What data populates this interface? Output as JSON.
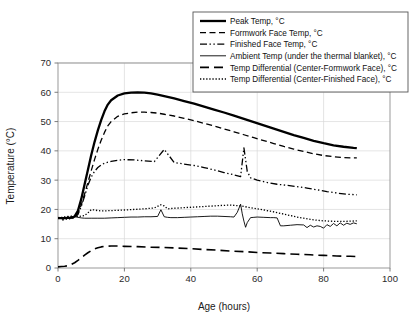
{
  "chart_data": {
    "type": "line",
    "title": "",
    "xlabel": "Age (hours)",
    "ylabel": "Temperature (°C)",
    "xlim": [
      0,
      100
    ],
    "ylim": [
      0,
      70
    ],
    "xticks": [
      0,
      20,
      40,
      60,
      80,
      100
    ],
    "yticks": [
      0,
      10,
      20,
      30,
      40,
      50,
      60,
      70
    ],
    "grid": true,
    "legend_position": "top-right",
    "series": [
      {
        "name": "Peak Temp, °C",
        "style": "solid-thick",
        "x": [
          0,
          1,
          2,
          3,
          4,
          5,
          6,
          7,
          8,
          9,
          10,
          11,
          12,
          13,
          14,
          15,
          16,
          18,
          20,
          22,
          24,
          26,
          28,
          30,
          32,
          35,
          38,
          41,
          44,
          47,
          50,
          53,
          56,
          59,
          62,
          65,
          68,
          71,
          74,
          77,
          80,
          83,
          86,
          89,
          90
        ],
        "y": [
          17.0,
          17.0,
          17.0,
          17.1,
          17.2,
          17.6,
          19.5,
          23.5,
          28.5,
          33.5,
          38.5,
          43.0,
          47.0,
          50.5,
          53.5,
          55.8,
          57.3,
          58.9,
          59.6,
          59.9,
          60.0,
          59.9,
          59.6,
          59.2,
          58.7,
          57.9,
          57.0,
          56.1,
          55.1,
          54.1,
          53.1,
          52.0,
          50.9,
          49.8,
          48.7,
          47.6,
          46.5,
          45.4,
          44.4,
          43.4,
          42.6,
          41.9,
          41.4,
          41.0,
          40.9
        ]
      },
      {
        "name": "Formwork Face Temp, °C",
        "style": "dashed",
        "x": [
          0,
          1,
          2,
          3,
          4,
          5,
          6,
          7,
          8,
          9,
          10,
          11,
          12,
          13,
          14,
          15,
          16,
          18,
          20,
          22,
          24,
          26,
          28,
          30,
          32,
          35,
          38,
          41,
          44,
          47,
          50,
          53,
          56,
          59,
          62,
          65,
          68,
          71,
          74,
          77,
          80,
          83,
          86,
          89,
          90
        ],
        "y": [
          17.0,
          17.0,
          17.0,
          17.0,
          17.1,
          17.4,
          18.6,
          21.5,
          25.2,
          29.2,
          33.2,
          37.0,
          40.5,
          43.6,
          46.3,
          48.5,
          50.0,
          51.8,
          52.6,
          53.0,
          53.2,
          53.2,
          53.1,
          52.9,
          52.5,
          51.9,
          51.1,
          50.3,
          49.4,
          48.5,
          47.5,
          46.5,
          45.5,
          44.5,
          43.5,
          42.5,
          41.5,
          40.6,
          39.8,
          39.0,
          38.4,
          38.0,
          37.7,
          37.6,
          37.6
        ]
      },
      {
        "name": "Finished Face Temp, °C",
        "style": "dash-dot-dot",
        "x": [
          0,
          1,
          2,
          3,
          4,
          5,
          6,
          7,
          8,
          9,
          10,
          11,
          12,
          13,
          14,
          16,
          18,
          20,
          23,
          26,
          29,
          32,
          35,
          38,
          41,
          44,
          47,
          50,
          53,
          55,
          56,
          57,
          58,
          60,
          63,
          66,
          69,
          72,
          75,
          78,
          81,
          84,
          87,
          90
        ],
        "y": [
          17.0,
          17.0,
          17.0,
          17.0,
          17.1,
          17.3,
          18.3,
          21.0,
          24.5,
          28.2,
          31.0,
          33.0,
          34.3,
          35.2,
          35.8,
          36.4,
          36.8,
          37.0,
          36.9,
          36.6,
          36.3,
          40.5,
          36.0,
          35.5,
          35.0,
          34.3,
          33.5,
          32.6,
          31.8,
          31.2,
          41.0,
          33.0,
          30.8,
          30.0,
          29.2,
          28.6,
          28.2,
          27.8,
          27.3,
          26.7,
          26.1,
          25.6,
          25.2,
          25.0
        ]
      },
      {
        "name": "Ambient Temp (under the thermal blanket), °C",
        "style": "solid-thin",
        "x": [
          0,
          1,
          1.5,
          2,
          2.5,
          3,
          3.5,
          4,
          4.5,
          5,
          6,
          7,
          8,
          10,
          12,
          14,
          16,
          18,
          20,
          22,
          24,
          26,
          28,
          30,
          31,
          32,
          33,
          34,
          36,
          38,
          40,
          42,
          44,
          46,
          48,
          50,
          52,
          53,
          54,
          55,
          55.5,
          56,
          56.5,
          57,
          58,
          59,
          60,
          62,
          64,
          65,
          66,
          67,
          68,
          70,
          72,
          74,
          75,
          76,
          77,
          78,
          79,
          80,
          81,
          82,
          83,
          84,
          85,
          86,
          87,
          88,
          89,
          90
        ],
        "y": [
          17.2,
          17.2,
          16.2,
          17.6,
          16.5,
          17.8,
          16.6,
          17.9,
          16.8,
          17.6,
          17.3,
          17.1,
          17.0,
          17.0,
          17.0,
          17.0,
          17.1,
          17.2,
          17.3,
          17.4,
          17.4,
          17.5,
          17.5,
          17.6,
          19.9,
          17.5,
          17.3,
          17.2,
          17.2,
          17.3,
          17.4,
          17.5,
          17.6,
          17.7,
          17.7,
          17.6,
          17.5,
          17.4,
          19.0,
          21.8,
          18.5,
          16.0,
          13.9,
          15.5,
          17.2,
          17.3,
          17.4,
          17.3,
          17.2,
          17.2,
          17.1,
          14.4,
          14.4,
          14.6,
          14.8,
          14.7,
          13.8,
          14.6,
          14.0,
          14.4,
          14.2,
          13.6,
          14.8,
          14.2,
          15.2,
          14.4,
          15.4,
          14.6,
          15.3,
          14.9,
          15.4,
          15.1
        ]
      },
      {
        "name": "Temp Differential (Center-Formwork Face), °C",
        "style": "long-dash",
        "x": [
          0,
          1,
          2,
          3,
          4,
          5,
          6,
          7,
          8,
          9,
          10,
          11,
          12,
          13,
          14,
          16,
          18,
          20,
          24,
          28,
          32,
          36,
          40,
          44,
          48,
          52,
          56,
          60,
          64,
          68,
          72,
          76,
          80,
          84,
          88,
          90
        ],
        "y": [
          0.4,
          0.5,
          0.6,
          0.8,
          1.2,
          1.8,
          2.6,
          3.5,
          4.4,
          5.2,
          5.9,
          6.5,
          6.9,
          7.2,
          7.4,
          7.5,
          7.5,
          7.4,
          7.3,
          7.1,
          7.0,
          6.8,
          6.6,
          6.3,
          6.1,
          5.8,
          5.6,
          5.3,
          5.1,
          4.9,
          4.7,
          4.5,
          4.3,
          4.1,
          4.0,
          3.9
        ]
      },
      {
        "name": "Temp Differential (Center-Finished Face), °C",
        "style": "dotted",
        "x": [
          0,
          1,
          2,
          3,
          4,
          5,
          6,
          7,
          8,
          9,
          10,
          11,
          12,
          13,
          14,
          16,
          18,
          20,
          23,
          26,
          29,
          31,
          32,
          33,
          35,
          38,
          41,
          44,
          47,
          50,
          52,
          53,
          54,
          55,
          56,
          57,
          58,
          59,
          60,
          62,
          64,
          66,
          68,
          70,
          72,
          74,
          76,
          78,
          80,
          82,
          84,
          86,
          88,
          90
        ],
        "y": [
          17.2,
          17.3,
          17.3,
          17.4,
          17.4,
          17.5,
          17.6,
          17.7,
          17.9,
          18.8,
          19.9,
          19.8,
          19.6,
          19.5,
          19.5,
          19.6,
          19.7,
          19.8,
          20.0,
          20.2,
          20.5,
          21.6,
          21.2,
          20.2,
          20.4,
          20.6,
          20.8,
          21.0,
          21.2,
          21.4,
          21.5,
          21.4,
          21.3,
          21.2,
          21.0,
          20.8,
          20.6,
          20.4,
          20.2,
          19.8,
          19.4,
          18.9,
          18.4,
          17.9,
          17.4,
          17.0,
          16.6,
          16.3,
          16.1,
          16.0,
          15.9,
          15.9,
          16.0,
          16.1
        ]
      }
    ]
  },
  "legend": {
    "items": [
      {
        "label": "Peak Temp, °C",
        "style": "solid-thick"
      },
      {
        "label": "Formwork Face Temp, °C",
        "style": "dashed"
      },
      {
        "label": "Finished Face Temp, °C",
        "style": "dash-dot-dot"
      },
      {
        "label": "Ambient Temp (under the thermal blanket), °C",
        "style": "solid-thin"
      },
      {
        "label": "Temp Differential (Center-Formwork Face), °C",
        "style": "long-dash"
      },
      {
        "label": "Temp Differential (Center-Finished Face), °C",
        "style": "dotted"
      }
    ]
  },
  "colors": {
    "ink": "#000000",
    "grid": "#d8d8d8",
    "frame": "#8e8e8e",
    "background": "#ffffff"
  }
}
